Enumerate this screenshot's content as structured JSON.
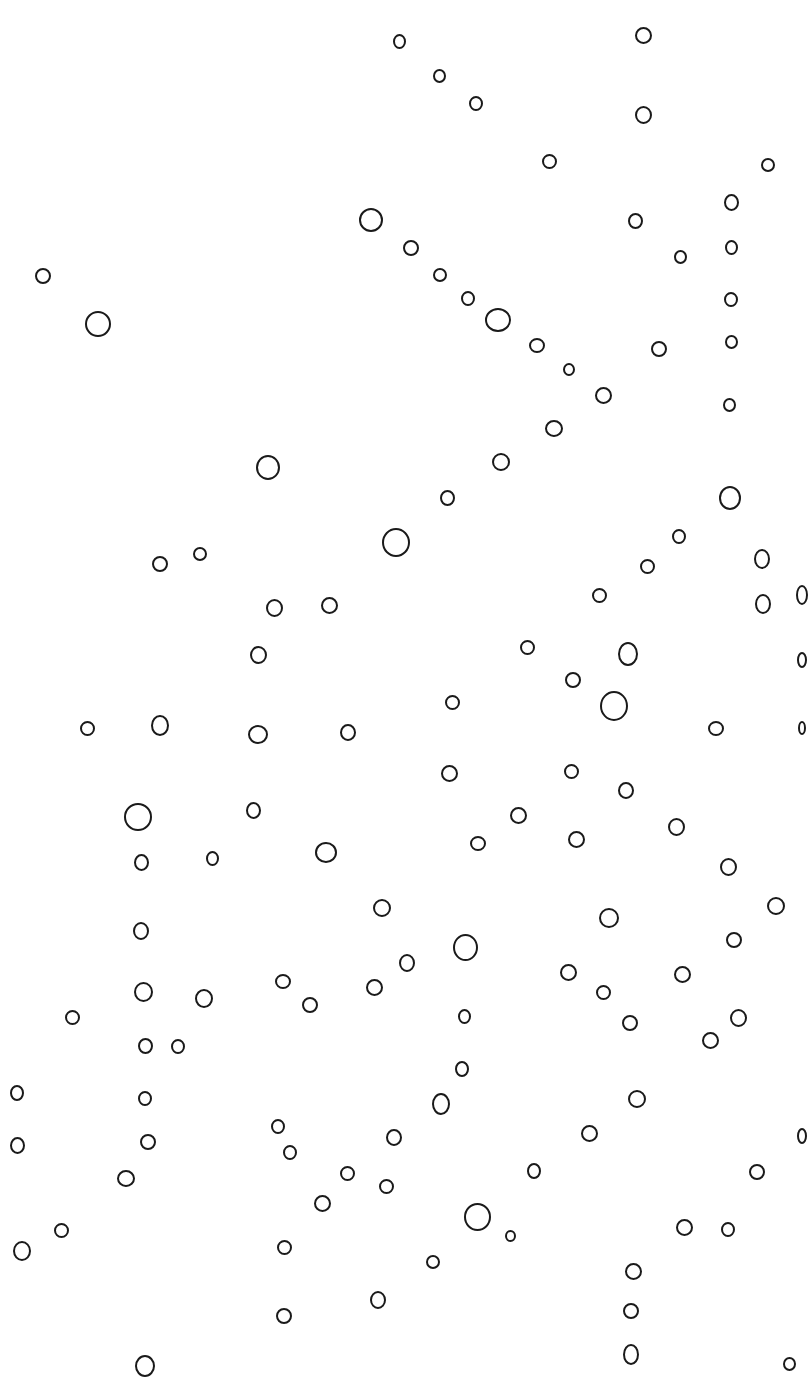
{
  "image": {
    "description": "Hand-drawn small black ink circles scattered on a white background",
    "background_color": "#ffffff",
    "stroke_color": "#1a1a1a",
    "circles": [
      [
        399,
        41,
        13,
        15
      ],
      [
        643,
        35,
        17,
        17
      ],
      [
        439,
        76,
        13,
        14
      ],
      [
        476,
        103,
        14,
        15
      ],
      [
        643,
        115,
        17,
        18
      ],
      [
        549,
        161,
        15,
        15
      ],
      [
        768,
        165,
        14,
        14
      ],
      [
        371,
        220,
        24,
        24
      ],
      [
        635,
        221,
        15,
        16
      ],
      [
        731,
        202,
        15,
        17
      ],
      [
        411,
        248,
        16,
        16
      ],
      [
        680,
        257,
        13,
        14
      ],
      [
        731,
        247,
        13,
        15
      ],
      [
        43,
        276,
        16,
        16
      ],
      [
        98,
        324,
        26,
        26
      ],
      [
        440,
        275,
        14,
        14
      ],
      [
        468,
        298,
        14,
        15
      ],
      [
        498,
        320,
        26,
        24
      ],
      [
        537,
        345,
        16,
        15
      ],
      [
        569,
        369,
        12,
        13
      ],
      [
        659,
        349,
        16,
        16
      ],
      [
        731,
        299,
        14,
        15
      ],
      [
        731,
        342,
        13,
        14
      ],
      [
        603,
        395,
        17,
        17
      ],
      [
        554,
        428,
        18,
        17
      ],
      [
        729,
        405,
        13,
        14
      ],
      [
        268,
        467,
        24,
        25
      ],
      [
        501,
        462,
        18,
        18
      ],
      [
        447,
        498,
        15,
        16
      ],
      [
        396,
        542,
        28,
        29
      ],
      [
        730,
        498,
        22,
        24
      ],
      [
        679,
        536,
        14,
        15
      ],
      [
        647,
        566,
        15,
        15
      ],
      [
        762,
        559,
        16,
        20
      ],
      [
        160,
        564,
        16,
        16
      ],
      [
        200,
        554,
        14,
        14
      ],
      [
        274,
        608,
        17,
        18
      ],
      [
        329,
        605,
        17,
        17
      ],
      [
        599,
        595,
        15,
        15
      ],
      [
        763,
        604,
        16,
        20
      ],
      [
        258,
        655,
        17,
        18
      ],
      [
        527,
        647,
        15,
        15
      ],
      [
        628,
        654,
        20,
        24
      ],
      [
        573,
        680,
        16,
        16
      ],
      [
        614,
        706,
        28,
        30
      ],
      [
        452,
        702,
        15,
        15
      ],
      [
        87,
        728,
        15,
        15
      ],
      [
        160,
        725,
        18,
        21
      ],
      [
        258,
        734,
        20,
        19
      ],
      [
        348,
        732,
        16,
        17
      ],
      [
        716,
        728,
        16,
        15
      ],
      [
        449,
        773,
        17,
        17
      ],
      [
        571,
        771,
        15,
        15
      ],
      [
        626,
        790,
        16,
        17
      ],
      [
        138,
        817,
        28,
        28
      ],
      [
        253,
        810,
        15,
        17
      ],
      [
        518,
        815,
        17,
        17
      ],
      [
        576,
        839,
        17,
        17
      ],
      [
        478,
        843,
        16,
        15
      ],
      [
        676,
        827,
        17,
        18
      ],
      [
        326,
        852,
        22,
        21
      ],
      [
        141,
        862,
        15,
        17
      ],
      [
        212,
        858,
        13,
        15
      ],
      [
        728,
        867,
        17,
        18
      ],
      [
        382,
        908,
        18,
        18
      ],
      [
        776,
        906,
        18,
        18
      ],
      [
        609,
        918,
        20,
        20
      ],
      [
        141,
        931,
        16,
        18
      ],
      [
        465,
        947,
        25,
        27
      ],
      [
        734,
        940,
        16,
        16
      ],
      [
        407,
        963,
        16,
        18
      ],
      [
        568,
        972,
        17,
        17
      ],
      [
        682,
        974,
        17,
        17
      ],
      [
        143,
        992,
        19,
        20
      ],
      [
        283,
        981,
        16,
        15
      ],
      [
        310,
        1005,
        16,
        16
      ],
      [
        374,
        987,
        17,
        17
      ],
      [
        204,
        998,
        18,
        19
      ],
      [
        72,
        1017,
        15,
        15
      ],
      [
        603,
        992,
        15,
        15
      ],
      [
        630,
        1023,
        16,
        16
      ],
      [
        738,
        1018,
        17,
        18
      ],
      [
        710,
        1040,
        17,
        17
      ],
      [
        464,
        1016,
        13,
        15
      ],
      [
        145,
        1046,
        15,
        16
      ],
      [
        178,
        1046,
        14,
        15
      ],
      [
        462,
        1069,
        14,
        16
      ],
      [
        441,
        1104,
        18,
        22
      ],
      [
        17,
        1093,
        14,
        16
      ],
      [
        145,
        1098,
        14,
        15
      ],
      [
        637,
        1099,
        18,
        18
      ],
      [
        17,
        1145,
        15,
        17
      ],
      [
        148,
        1142,
        16,
        16
      ],
      [
        278,
        1126,
        14,
        15
      ],
      [
        290,
        1152,
        14,
        15
      ],
      [
        394,
        1137,
        16,
        17
      ],
      [
        589,
        1133,
        17,
        17
      ],
      [
        126,
        1178,
        18,
        17
      ],
      [
        347,
        1173,
        15,
        15
      ],
      [
        386,
        1186,
        15,
        15
      ],
      [
        534,
        1171,
        14,
        16
      ],
      [
        757,
        1172,
        16,
        16
      ],
      [
        322,
        1203,
        17,
        17
      ],
      [
        477,
        1217,
        27,
        28
      ],
      [
        510,
        1236,
        11,
        12
      ],
      [
        61,
        1230,
        15,
        15
      ],
      [
        22,
        1251,
        18,
        20
      ],
      [
        284,
        1247,
        15,
        15
      ],
      [
        684,
        1227,
        17,
        17
      ],
      [
        728,
        1229,
        14,
        15
      ],
      [
        433,
        1262,
        14,
        14
      ],
      [
        633,
        1271,
        17,
        17
      ],
      [
        378,
        1300,
        16,
        18
      ],
      [
        284,
        1316,
        16,
        16
      ],
      [
        631,
        1311,
        16,
        16
      ],
      [
        631,
        1354,
        16,
        21
      ],
      [
        789,
        1364,
        13,
        14
      ],
      [
        145,
        1366,
        20,
        22
      ],
      [
        802,
        595,
        12,
        20
      ],
      [
        802,
        660,
        10,
        16
      ],
      [
        802,
        728,
        8,
        14
      ],
      [
        802,
        1136,
        10,
        16
      ]
    ]
  }
}
